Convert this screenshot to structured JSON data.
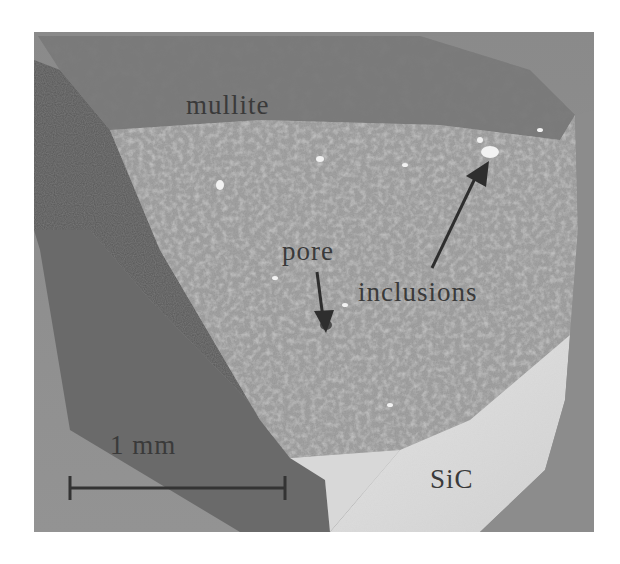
{
  "figure": {
    "labels": {
      "mullite": "mullite",
      "pore": "pore",
      "inclusions": "inclusions",
      "substrate": "SiC",
      "scale": "1 mm"
    },
    "colors": {
      "background": "#ffffff",
      "photo_background": "#8d8d8d",
      "shadow_face": "#5a5a5a",
      "shadow_face_dark": "#4a4a4a",
      "mullite_face": "#8f8f8f",
      "mullite_top": "#6e6e6e",
      "sic_face": "#dcdcdc",
      "sic_face_light": "#e8e8e8",
      "label_text": "#3a3a3a",
      "arrow": "#2e2e2e"
    }
  }
}
